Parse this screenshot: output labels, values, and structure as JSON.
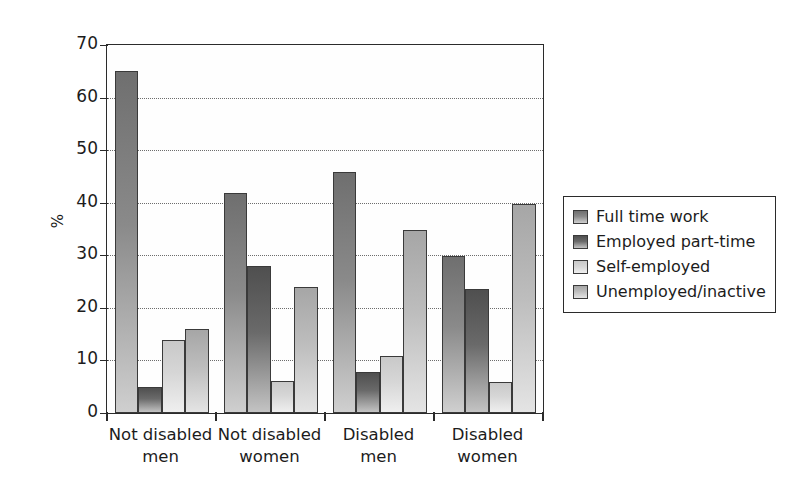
{
  "chart_data": {
    "type": "bar",
    "title": "",
    "xlabel": "",
    "ylabel": "%",
    "ylim": [
      0,
      70
    ],
    "ytick_labels": [
      "70",
      "60",
      "50",
      "40",
      "30",
      "20",
      "10",
      "0"
    ],
    "ytick_values": [
      70,
      60,
      50,
      40,
      30,
      20,
      10,
      0
    ],
    "grid": "horizontal dotted gridlines at 10,20,30,40,50,60",
    "legend_position": "right",
    "categories": [
      "Not disabled men",
      "Not disabled women",
      "Disabled men",
      "Disabled women"
    ],
    "category_lines": [
      [
        "Not disabled",
        "men"
      ],
      [
        "Not disabled",
        "women"
      ],
      [
        "Disabled",
        "men"
      ],
      [
        "Disabled",
        "women"
      ]
    ],
    "series": [
      {
        "name": "Full time work",
        "values": [
          65,
          41.8,
          45.8,
          29.8
        ],
        "color": "#8a8a8a"
      },
      {
        "name": "Employed part-time",
        "values": [
          4.9,
          28,
          7.8,
          23.6
        ],
        "color": "#6a6a6a"
      },
      {
        "name": "Self-employed",
        "values": [
          13.9,
          6,
          10.9,
          5.9
        ],
        "color": "#d6d6d6"
      },
      {
        "name": "Unemployed/inactive",
        "values": [
          15.9,
          23.9,
          34.8,
          39.8
        ],
        "color": "#bdbdbd"
      }
    ]
  },
  "legend": {
    "items": [
      {
        "label": "Full time work"
      },
      {
        "label": "Employed part-time"
      },
      {
        "label": "Self-employed"
      },
      {
        "label": "Unemployed/inactive"
      }
    ]
  },
  "axis": {
    "y_label": "%",
    "y_ticks": [
      "70",
      "60",
      "50",
      "40",
      "30",
      "20",
      "10",
      "0"
    ]
  }
}
